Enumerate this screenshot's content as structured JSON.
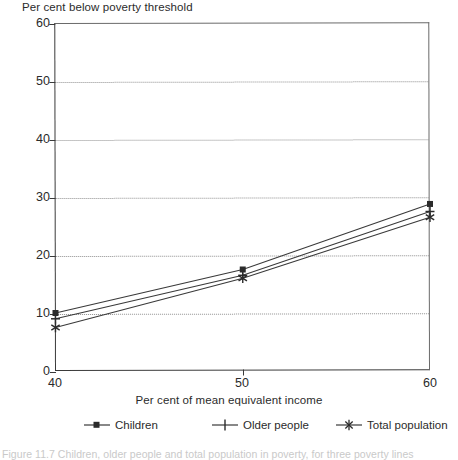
{
  "chart_data": {
    "type": "line",
    "title": "Per cent below poverty threshold",
    "xlabel": "Per cent of mean equivalent income",
    "ylabel": "Per cent below poverty threshold",
    "x": [
      40,
      50,
      60
    ],
    "xlim": [
      40,
      60
    ],
    "ylim": [
      0,
      60
    ],
    "xticks": [
      "40",
      "50",
      "60"
    ],
    "yticks": [
      "0",
      "10",
      "20",
      "30",
      "40",
      "50",
      "60"
    ],
    "grid": "horizontal-dotted",
    "legend_position": "below-axes",
    "series": [
      {
        "name": "Children",
        "marker": "square",
        "values": [
          10.0,
          17.5,
          28.8
        ]
      },
      {
        "name": "Older people",
        "marker": "plus",
        "values": [
          9.0,
          16.5,
          27.5
        ]
      },
      {
        "name": "Total population",
        "marker": "star",
        "values": [
          7.5,
          16.0,
          26.5
        ]
      }
    ]
  },
  "caption": {
    "text": "Figure 11.7   Children, older people and total population in poverty, for three poverty lines"
  },
  "colors": {
    "ink": "#2b2b2b",
    "axis": "#3a3a3a",
    "grid": "#8d8d8d",
    "series": "#3a3a3a",
    "background": "#ffffff",
    "caption": "#c9c9c9"
  }
}
